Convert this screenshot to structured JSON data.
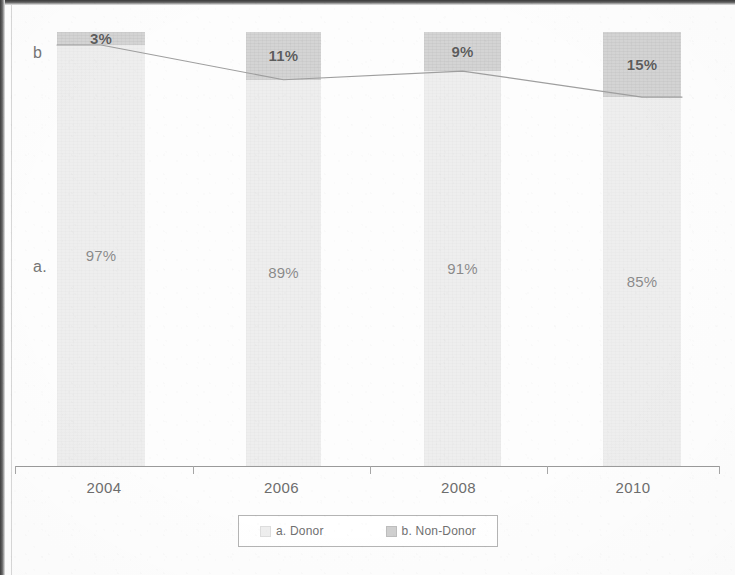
{
  "chart_data": {
    "type": "bar",
    "subtype": "100% stacked column with boundary connector line",
    "title": "",
    "xlabel": "",
    "ylabel": "",
    "ylim": [
      0,
      100
    ],
    "grid": false,
    "legend_position": "bottom",
    "categories": [
      "2004",
      "2006",
      "2008",
      "2010"
    ],
    "series": [
      {
        "name": "a. Donor",
        "key": "a",
        "color": "#eeeeee",
        "values": [
          97,
          89,
          91,
          85
        ],
        "labels": [
          "97%",
          "89%",
          "91%",
          "85%"
        ]
      },
      {
        "name": "b. Non-Donor",
        "key": "b",
        "color": "#d4d4d4",
        "values": [
          3,
          11,
          9,
          15
        ],
        "labels": [
          "3%",
          "11%",
          "9%",
          "15%"
        ]
      }
    ],
    "row_labels": [
      {
        "text": "b",
        "series": "b. Non-Donor"
      },
      {
        "text": "a.",
        "series": "a. Donor"
      }
    ],
    "connector_line": {
      "description": "line tracing top of the 'a. Donor' segment across categories",
      "values": [
        97,
        89,
        91,
        85
      ]
    }
  },
  "axis": {
    "tick_labels": [
      "2004",
      "2006",
      "2008",
      "2010"
    ]
  },
  "legend": {
    "entries": [
      {
        "label": "a. Donor",
        "swatch": "legend-swatch-donor"
      },
      {
        "label": "b. Non-Donor",
        "swatch": "legend-swatch-non-donor"
      }
    ]
  },
  "colors": {
    "series_a": "#eeeeee",
    "series_b": "#d4d4d4",
    "axis": "#9a9a9a",
    "text": "#6d6d6d",
    "connector": "#9e9e9e"
  }
}
